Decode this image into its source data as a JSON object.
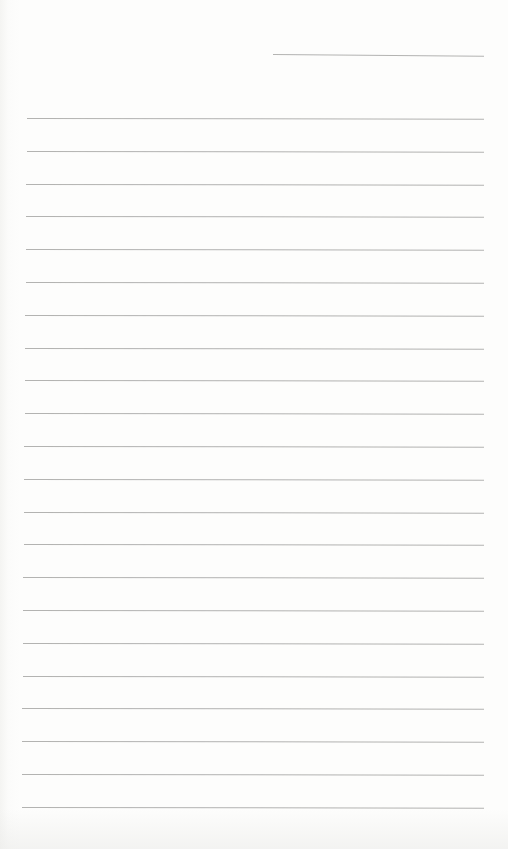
{
  "document": {
    "type": "lined-writing-sheet",
    "header_line": {
      "label": ""
    },
    "ruled_lines": {
      "count": 22,
      "first_y": 118,
      "spacing": 32.8,
      "left_x": 27,
      "right_x": 484
    },
    "text_content": ""
  },
  "colors": {
    "paper": "#fdfdfc",
    "rule": "#9a9a98"
  }
}
